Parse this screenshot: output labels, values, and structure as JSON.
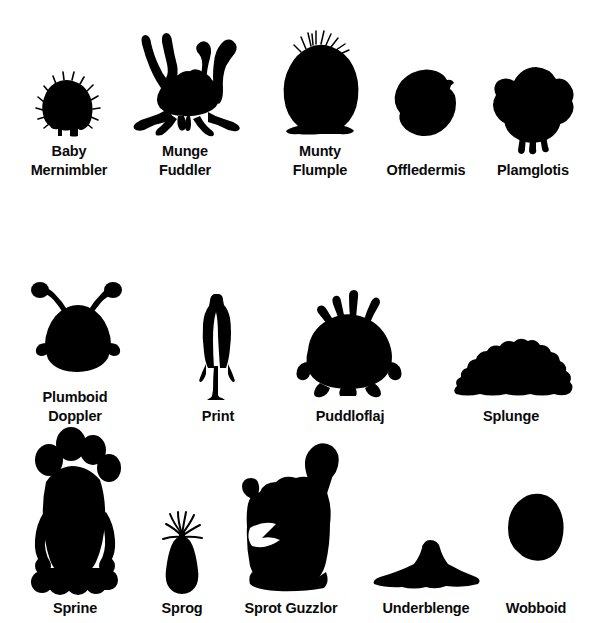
{
  "page": {
    "background_color": "#ffffff",
    "silhouette_color": "#000000",
    "text_color": "#0a0a0a",
    "width": 593,
    "height": 623
  },
  "rows": [
    {
      "index": 1,
      "creatures": [
        {
          "name": "Baby\nMernimbler",
          "icon": "baby-mernimbler-silhouette",
          "label_line1": "Baby",
          "label_line2": "Mernimbler",
          "left": 14,
          "caption_top": 140,
          "art_width": 110,
          "art_height": 120,
          "shape": "small-fuzzy-dome"
        },
        {
          "name": "Munge\nFuddler",
          "icon": "munge-fuddler-silhouette",
          "label_line1": "Munge",
          "label_line2": "Fuddler",
          "left": 120,
          "caption_top": 140,
          "art_width": 130,
          "art_height": 120,
          "shape": "crab-with-eyestalks"
        },
        {
          "name": "Munty\nFlumple",
          "icon": "munty-flumple-silhouette",
          "label_line1": "Munty",
          "label_line2": "Flumple",
          "left": 268,
          "caption_top": 140,
          "art_width": 104,
          "art_height": 120,
          "shape": "round-blob-with-hair-tuft"
        },
        {
          "name": "Offledermis",
          "icon": "offledermis-silhouette",
          "label_line1": "Offledermis",
          "label_line2": "",
          "left": 378,
          "caption_top": 140,
          "art_width": 96,
          "art_height": 120,
          "shape": "tilted-lemon-blob"
        },
        {
          "name": "Plamglotis",
          "icon": "plamglotis-silhouette",
          "label_line1": "Plamglotis",
          "label_line2": "",
          "left": 478,
          "caption_top": 140,
          "art_width": 110,
          "art_height": 120,
          "shape": "bird-blob-with-legs"
        }
      ]
    },
    {
      "index": 2,
      "creatures": [
        {
          "name": "Plumboid\nDoppler",
          "icon": "plumboid-doppler-silhouette",
          "label_line1": "Plumboid",
          "label_line2": "Doppler",
          "left": 18,
          "caption_top": 366,
          "art_width": 114,
          "art_height": 125,
          "shape": "dome-with-club-antennae"
        },
        {
          "name": "Print",
          "icon": "print-silhouette",
          "label_line1": "Print",
          "label_line2": "",
          "left": 170,
          "caption_top": 366,
          "art_width": 96,
          "art_height": 125,
          "shape": "tall-thin-biped"
        },
        {
          "name": "Puddloflaj",
          "icon": "puddloflaj-silhouette",
          "label_line1": "Puddloflaj",
          "label_line2": "",
          "left": 288,
          "caption_top": 366,
          "art_width": 124,
          "art_height": 125,
          "shape": "fat-blob-with-four-stalks"
        },
        {
          "name": "Splunge",
          "icon": "splunge-silhouette",
          "label_line1": "Splunge",
          "label_line2": "",
          "left": 446,
          "caption_top": 366,
          "art_width": 130,
          "art_height": 125,
          "shape": "lumpy-mound"
        }
      ]
    },
    {
      "index": 3,
      "creatures": [
        {
          "name": "Sprine",
          "icon": "sprine-silhouette",
          "label_line1": "Sprine",
          "label_line2": "",
          "left": 16,
          "caption_top": 598,
          "art_width": 118,
          "art_height": 175,
          "shape": "tall-tentacled-with-bulb-crown"
        },
        {
          "name": "Sprog",
          "icon": "sprog-silhouette",
          "label_line1": "Sprog",
          "label_line2": "",
          "left": 140,
          "caption_top": 598,
          "art_width": 84,
          "art_height": 175,
          "shape": "tiny-teardrop-with-fronds"
        },
        {
          "name": "Sprot Guzzlor",
          "icon": "sprot-guzzlor-silhouette",
          "label_line1": "Sprot Guzzlor",
          "label_line2": "",
          "left": 228,
          "caption_top": 598,
          "art_width": 126,
          "art_height": 175,
          "shape": "squat-lump-with-curled-tail"
        },
        {
          "name": "Underblenge",
          "icon": "underblenge-silhouette",
          "label_line1": "Underblenge",
          "label_line2": "",
          "left": 368,
          "caption_top": 598,
          "art_width": 116,
          "art_height": 175,
          "shape": "flat-ray-with-hump"
        },
        {
          "name": "Wobboid",
          "icon": "wobboid-silhouette",
          "label_line1": "Wobboid",
          "label_line2": "",
          "left": 488,
          "caption_top": 598,
          "art_width": 96,
          "art_height": 175,
          "shape": "egg-blob"
        }
      ]
    }
  ]
}
